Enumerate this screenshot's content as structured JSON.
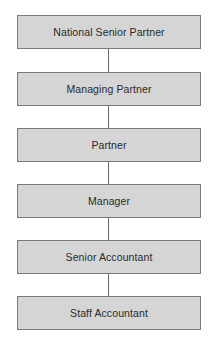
{
  "diagram": {
    "type": "org-chart-vertical",
    "nodes": [
      {
        "id": "n1",
        "label": "National Senior Partner"
      },
      {
        "id": "n2",
        "label": "Managing Partner"
      },
      {
        "id": "n3",
        "label": "Partner"
      },
      {
        "id": "n4",
        "label": "Manager"
      },
      {
        "id": "n5",
        "label": "Senior Accountant"
      },
      {
        "id": "n6",
        "label": "Staff Accountant"
      }
    ],
    "edges": [
      {
        "from": "n1",
        "to": "n2"
      },
      {
        "from": "n2",
        "to": "n3"
      },
      {
        "from": "n3",
        "to": "n4"
      },
      {
        "from": "n4",
        "to": "n5"
      },
      {
        "from": "n5",
        "to": "n6"
      }
    ],
    "colors": {
      "box_fill": "#d5d5d5",
      "box_border": "#7a7a7a",
      "connector": "#6a6a6a",
      "text": "#2a2a2a"
    }
  }
}
